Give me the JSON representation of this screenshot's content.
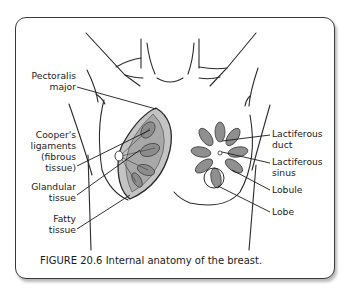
{
  "figure": {
    "caption": "FIGURE 20.6 Internal anatomy of the breast.",
    "colors": {
      "frame_border": "#3a3a3a",
      "line": "#2a2a2a",
      "tissue_fill": "#b5b5b5",
      "lobe_fill": "#8f8f8f",
      "background": "#ffffff"
    }
  },
  "labels": {
    "left": [
      {
        "lines": [
          "Pectoralis",
          "major"
        ]
      },
      {
        "lines": [
          "Cooper's",
          "ligaments",
          "(fibrous",
          "tissue)"
        ]
      },
      {
        "lines": [
          "Glandular",
          "tissue"
        ]
      },
      {
        "lines": [
          "Fatty",
          "tissue"
        ]
      }
    ],
    "right": [
      {
        "lines": [
          "Lactiferous",
          "duct"
        ]
      },
      {
        "lines": [
          "Lactiferous",
          "sinus"
        ]
      },
      {
        "lines": [
          "Lobule"
        ]
      },
      {
        "lines": [
          "Lobe"
        ]
      }
    ]
  }
}
